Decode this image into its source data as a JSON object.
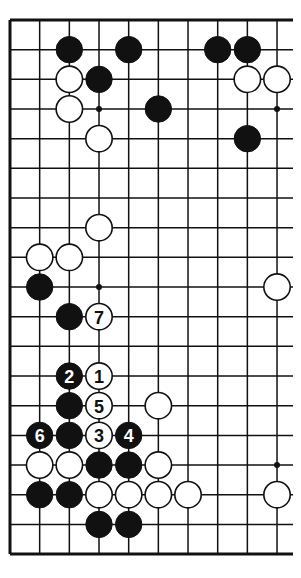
{
  "diagram": {
    "type": "go-board",
    "grid": {
      "columns": 10,
      "rows": 19,
      "origin_x": 10,
      "origin_y": 20,
      "spacing": 29.67,
      "right_extension": 293,
      "edges": [
        "top",
        "left",
        "bottom"
      ]
    },
    "colors": {
      "line": "#111111",
      "black_stone": "#111111",
      "white_stone": "#ffffff",
      "background": "#ffffff"
    },
    "star_points": [
      {
        "col": 3,
        "row": 3
      },
      {
        "col": 9,
        "row": 3
      },
      {
        "col": 3,
        "row": 9
      },
      {
        "col": 9,
        "row": 15
      }
    ],
    "stones": [
      {
        "col": 2,
        "row": 1,
        "color": "black",
        "label": ""
      },
      {
        "col": 4,
        "row": 1,
        "color": "black",
        "label": ""
      },
      {
        "col": 7,
        "row": 1,
        "color": "black",
        "label": ""
      },
      {
        "col": 8,
        "row": 1,
        "color": "black",
        "label": ""
      },
      {
        "col": 2,
        "row": 2,
        "color": "white",
        "label": ""
      },
      {
        "col": 3,
        "row": 2,
        "color": "black",
        "label": ""
      },
      {
        "col": 8,
        "row": 2,
        "color": "white",
        "label": ""
      },
      {
        "col": 9,
        "row": 2,
        "color": "white",
        "label": ""
      },
      {
        "col": 2,
        "row": 3,
        "color": "white",
        "label": ""
      },
      {
        "col": 5,
        "row": 3,
        "color": "black",
        "label": ""
      },
      {
        "col": 3,
        "row": 4,
        "color": "white",
        "label": ""
      },
      {
        "col": 8,
        "row": 4,
        "color": "black",
        "label": ""
      },
      {
        "col": 3,
        "row": 7,
        "color": "white",
        "label": ""
      },
      {
        "col": 1,
        "row": 8,
        "color": "white",
        "label": ""
      },
      {
        "col": 2,
        "row": 8,
        "color": "white",
        "label": ""
      },
      {
        "col": 1,
        "row": 9,
        "color": "black",
        "label": ""
      },
      {
        "col": 9,
        "row": 9,
        "color": "white",
        "label": ""
      },
      {
        "col": 2,
        "row": 10,
        "color": "black",
        "label": ""
      },
      {
        "col": 3,
        "row": 10,
        "color": "white",
        "label": "7"
      },
      {
        "col": 2,
        "row": 12,
        "color": "black",
        "label": "2"
      },
      {
        "col": 3,
        "row": 12,
        "color": "white",
        "label": "1"
      },
      {
        "col": 2,
        "row": 13,
        "color": "black",
        "label": ""
      },
      {
        "col": 3,
        "row": 13,
        "color": "white",
        "label": "5"
      },
      {
        "col": 5,
        "row": 13,
        "color": "white",
        "label": ""
      },
      {
        "col": 1,
        "row": 14,
        "color": "black",
        "label": "6"
      },
      {
        "col": 2,
        "row": 14,
        "color": "black",
        "label": ""
      },
      {
        "col": 3,
        "row": 14,
        "color": "white",
        "label": "3"
      },
      {
        "col": 4,
        "row": 14,
        "color": "black",
        "label": "4"
      },
      {
        "col": 1,
        "row": 15,
        "color": "white",
        "label": ""
      },
      {
        "col": 2,
        "row": 15,
        "color": "white",
        "label": ""
      },
      {
        "col": 3,
        "row": 15,
        "color": "black",
        "label": ""
      },
      {
        "col": 4,
        "row": 15,
        "color": "black",
        "label": ""
      },
      {
        "col": 5,
        "row": 15,
        "color": "white",
        "label": ""
      },
      {
        "col": 1,
        "row": 16,
        "color": "black",
        "label": ""
      },
      {
        "col": 2,
        "row": 16,
        "color": "black",
        "label": ""
      },
      {
        "col": 3,
        "row": 16,
        "color": "white",
        "label": ""
      },
      {
        "col": 4,
        "row": 16,
        "color": "white",
        "label": ""
      },
      {
        "col": 5,
        "row": 16,
        "color": "white",
        "label": ""
      },
      {
        "col": 6,
        "row": 16,
        "color": "white",
        "label": ""
      },
      {
        "col": 9,
        "row": 16,
        "color": "white",
        "label": ""
      },
      {
        "col": 3,
        "row": 17,
        "color": "black",
        "label": ""
      },
      {
        "col": 4,
        "row": 17,
        "color": "black",
        "label": ""
      }
    ]
  }
}
